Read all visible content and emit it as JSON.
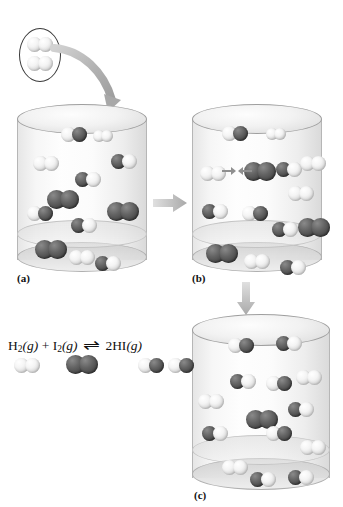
{
  "figure": {
    "background_color": "#ffffff"
  },
  "colors": {
    "hydrogen_atom": "#e8e8e8",
    "iodine_atom": "#4a4a4a",
    "cylinder_glass": "#e4e4e4",
    "arrow_gray": "#b5b5b5",
    "label_text": "#111111"
  },
  "panels": [
    {
      "id": "a",
      "label": "(a)",
      "caption_position": "bottom-left",
      "molecules": [
        {
          "type": "HI",
          "x": 44,
          "y": 23,
          "size": "normal",
          "flip": false
        },
        {
          "type": "H2",
          "x": 76,
          "y": 26,
          "size": "small",
          "flip": false
        },
        {
          "type": "H2",
          "x": 16,
          "y": 52,
          "size": "normal",
          "flip": false
        },
        {
          "type": "HI",
          "x": 94,
          "y": 50,
          "size": "normal",
          "flip": true
        },
        {
          "type": "HI",
          "x": 58,
          "y": 68,
          "size": "normal",
          "flip": true
        },
        {
          "type": "I2",
          "x": 30,
          "y": 86,
          "size": "big",
          "flip": false
        },
        {
          "type": "HI",
          "x": 10,
          "y": 102,
          "size": "normal",
          "flip": false
        },
        {
          "type": "I2",
          "x": 90,
          "y": 98,
          "size": "big",
          "flip": false
        },
        {
          "type": "HI",
          "x": 54,
          "y": 114,
          "size": "normal",
          "flip": true
        },
        {
          "type": "I2",
          "x": 18,
          "y": 136,
          "size": "big",
          "flip": false
        },
        {
          "type": "H2",
          "x": 52,
          "y": 146,
          "size": "normal",
          "flip": false
        },
        {
          "type": "HI",
          "x": 78,
          "y": 152,
          "size": "normal",
          "flip": true
        }
      ]
    },
    {
      "id": "b",
      "label": "(b)",
      "caption_position": "bottom-left",
      "collision": {
        "description": "H2 and I2 molecules approaching each other"
      },
      "molecules": [
        {
          "type": "HI",
          "x": 30,
          "y": 22,
          "size": "normal",
          "flip": false
        },
        {
          "type": "H2",
          "x": 74,
          "y": 24,
          "size": "small",
          "flip": false
        },
        {
          "type": "H2",
          "x": 8,
          "y": 62,
          "size": "normal",
          "flip": false
        },
        {
          "type": "I2",
          "x": 52,
          "y": 58,
          "size": "big",
          "flip": false
        },
        {
          "type": "HI",
          "x": 84,
          "y": 58,
          "size": "normal",
          "flip": true
        },
        {
          "type": "H2",
          "x": 108,
          "y": 52,
          "size": "normal",
          "flip": false
        },
        {
          "type": "H2",
          "x": 96,
          "y": 82,
          "size": "normal",
          "flip": false
        },
        {
          "type": "HI",
          "x": 10,
          "y": 100,
          "size": "normal",
          "flip": true
        },
        {
          "type": "HI",
          "x": 50,
          "y": 102,
          "size": "normal",
          "flip": false
        },
        {
          "type": "HI",
          "x": 80,
          "y": 118,
          "size": "normal",
          "flip": true
        },
        {
          "type": "I2",
          "x": 106,
          "y": 114,
          "size": "big",
          "flip": false
        },
        {
          "type": "I2",
          "x": 14,
          "y": 140,
          "size": "big",
          "flip": false
        },
        {
          "type": "H2",
          "x": 52,
          "y": 150,
          "size": "normal",
          "flip": false
        },
        {
          "type": "HI",
          "x": 88,
          "y": 156,
          "size": "normal",
          "flip": true
        }
      ]
    },
    {
      "id": "c",
      "label": "(c)",
      "caption_position": "bottom-center",
      "molecules": [
        {
          "type": "HI",
          "x": 36,
          "y": 24,
          "size": "normal",
          "flip": false
        },
        {
          "type": "HI",
          "x": 84,
          "y": 22,
          "size": "normal",
          "flip": true
        },
        {
          "type": "HI",
          "x": 38,
          "y": 60,
          "size": "normal",
          "flip": true
        },
        {
          "type": "HI",
          "x": 74,
          "y": 62,
          "size": "normal",
          "flip": false
        },
        {
          "type": "H2",
          "x": 104,
          "y": 56,
          "size": "normal",
          "flip": false
        },
        {
          "type": "H2",
          "x": 6,
          "y": 80,
          "size": "normal",
          "flip": false
        },
        {
          "type": "I2",
          "x": 54,
          "y": 96,
          "size": "big",
          "flip": false
        },
        {
          "type": "HI",
          "x": 96,
          "y": 88,
          "size": "normal",
          "flip": true
        },
        {
          "type": "HI",
          "x": 10,
          "y": 112,
          "size": "normal",
          "flip": true
        },
        {
          "type": "HI",
          "x": 74,
          "y": 112,
          "size": "normal",
          "flip": false
        },
        {
          "type": "H2",
          "x": 108,
          "y": 126,
          "size": "normal",
          "flip": false
        },
        {
          "type": "H2",
          "x": 30,
          "y": 146,
          "size": "normal",
          "flip": false
        },
        {
          "type": "HI",
          "x": 58,
          "y": 158,
          "size": "normal",
          "flip": true
        },
        {
          "type": "HI",
          "x": 96,
          "y": 156,
          "size": "normal",
          "flip": true
        }
      ]
    }
  ],
  "inset": {
    "description": "Two hydrogen molecules being added",
    "molecules": [
      {
        "type": "H2",
        "x": 7,
        "y": 8
      },
      {
        "type": "H2",
        "x": 7,
        "y": 27
      }
    ]
  },
  "arrows": [
    {
      "name": "inject-arrow",
      "kind": "curved",
      "from": "inset",
      "to": "panel-a"
    },
    {
      "name": "a-to-b-arrow",
      "kind": "straight-right",
      "from": "panel-a",
      "to": "panel-b"
    },
    {
      "name": "b-to-c-arrow",
      "kind": "straight-down",
      "from": "panel-b",
      "to": "panel-c"
    }
  ],
  "legend": {
    "equation": {
      "reactant1": "H",
      "reactant1_sub": "2",
      "reactant1_state": "(g)",
      "plus": "+",
      "reactant2": "I",
      "reactant2_sub": "2",
      "reactant2_state": "(g)",
      "equilibrium_arrow": "⇌",
      "product_coeff": "2",
      "product": "HI",
      "product_state": "(g)",
      "full_text": "H2(g) + I2(g) ⇌ 2HI(g)"
    },
    "models": [
      {
        "name": "h2-model",
        "type": "H2",
        "x": 6,
        "label": "hydrogen molecule"
      },
      {
        "name": "i2-model",
        "type": "I2",
        "x": 60,
        "label": "iodine molecule"
      },
      {
        "name": "hi-model-1",
        "type": "HI",
        "x": 130,
        "label": "hydrogen iodide molecule"
      },
      {
        "name": "hi-model-2",
        "type": "HI",
        "x": 158,
        "label": "hydrogen iodide molecule"
      }
    ]
  }
}
